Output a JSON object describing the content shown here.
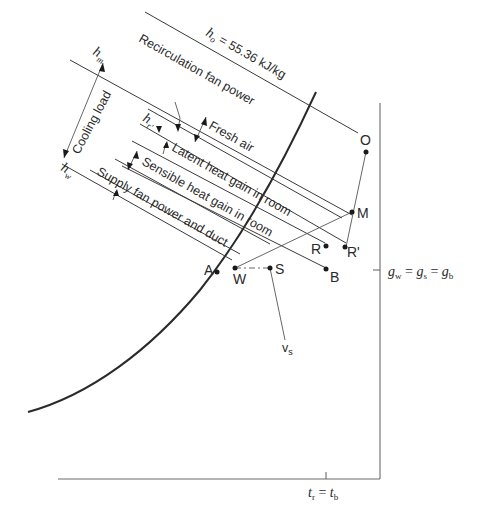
{
  "diagram": {
    "enthalpy_labels": {
      "h_o": "h",
      "h_o_sub": "o",
      "h_o_value": " = 55.36 kJ/kg",
      "h_m": "h",
      "h_m_sub": "m",
      "h_r": "h",
      "h_r_sub": "r'",
      "h_w": "h",
      "h_w_sub": "w"
    },
    "bands": {
      "cooling_load": "Cooling load",
      "recirculation_fan_power": "Recirculation fan power",
      "fresh_air": "Fresh air",
      "latent_heat_gain": "Latent heat gain in room",
      "sensible_heat_gain": "Sensible heat gain in room",
      "supply_fan_power": "Supply fan power and duct"
    },
    "points": {
      "O": "O",
      "M": "M",
      "R": "R",
      "R_prime": "R'",
      "B": "B",
      "A": "A",
      "W": "W",
      "S": "S"
    },
    "axis_labels": {
      "moisture": "g",
      "moisture_w_sub": "w",
      "moisture_s_sub": "s",
      "moisture_b_sub": "b",
      "eq": " = ",
      "temperature_r": "t",
      "temperature_r_sub": "r",
      "temperature_b": "t",
      "temperature_b_sub": "b",
      "specific_volume": "v",
      "specific_volume_sub": "s"
    }
  }
}
